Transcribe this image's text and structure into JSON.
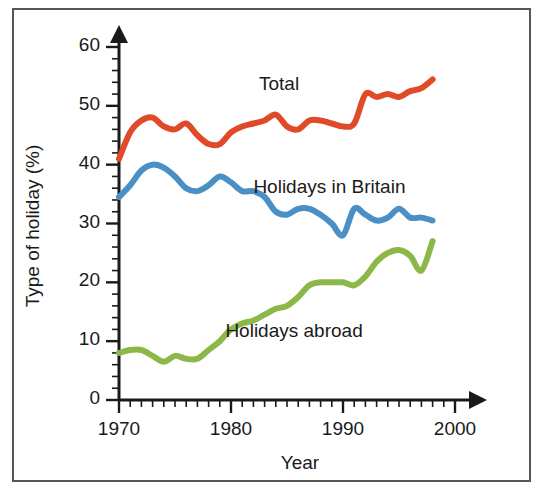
{
  "figure": {
    "border_color": "#55555c",
    "background": "#ffffff"
  },
  "chart_data": {
    "type": "line",
    "title": "",
    "xlabel": "Year",
    "ylabel": "Type of holiday (%)",
    "xlim": [
      1970,
      2000
    ],
    "ylim": [
      0,
      60
    ],
    "xticks": [
      1970,
      1980,
      1990,
      2000
    ],
    "xtick_labels": [
      "1970",
      "1980",
      "1990",
      "2000"
    ],
    "yticks": [
      0,
      10,
      20,
      30,
      40,
      50,
      60
    ],
    "ytick_labels": [
      "0",
      "10",
      "20",
      "30",
      "40",
      "50",
      "60"
    ],
    "x_minor_tick_step": 1,
    "y_minor_tick_step": 2,
    "grid": false,
    "legend_position": "inline-annotations",
    "x": [
      1970,
      1971,
      1972,
      1973,
      1974,
      1975,
      1976,
      1977,
      1978,
      1979,
      1980,
      1981,
      1982,
      1983,
      1984,
      1985,
      1986,
      1987,
      1988,
      1989,
      1990,
      1991,
      1992,
      1993,
      1994,
      1995,
      1996,
      1997,
      1998
    ],
    "series": [
      {
        "name": "Total",
        "color": "#e04a28",
        "values": [
          41.0,
          45.5,
          47.5,
          48.0,
          46.5,
          46.0,
          47.0,
          45.0,
          43.5,
          43.5,
          45.5,
          46.5,
          47.0,
          47.5,
          48.5,
          46.5,
          46.0,
          47.5,
          47.5,
          47.0,
          46.5,
          47.0,
          52.0,
          51.5,
          52.0,
          51.5,
          52.5,
          53.0,
          54.5
        ]
      },
      {
        "name": "Holidays in Britain",
        "color": "#4a90c4",
        "values": [
          34.5,
          36.5,
          39.0,
          40.0,
          39.5,
          38.0,
          36.0,
          35.5,
          36.5,
          38.0,
          37.0,
          35.5,
          35.5,
          34.5,
          32.0,
          31.5,
          32.5,
          32.5,
          31.5,
          30.0,
          28.0,
          32.5,
          31.5,
          30.5,
          31.0,
          32.5,
          31.0,
          31.0,
          30.5
        ]
      },
      {
        "name": "Holidays abroad",
        "color": "#8cb84a",
        "values": [
          8.0,
          8.5,
          8.5,
          7.5,
          6.5,
          7.5,
          7.0,
          7.0,
          8.5,
          10.0,
          12.0,
          13.0,
          13.5,
          14.5,
          15.5,
          16.0,
          17.5,
          19.5,
          20.0,
          20.0,
          20.0,
          19.5,
          21.0,
          23.5,
          25.0,
          25.5,
          24.5,
          22.0,
          27.0
        ]
      }
    ],
    "annotations": [
      {
        "text": "Total",
        "x": 1982.5,
        "y": 53.5
      },
      {
        "text": "Holidays in Britain",
        "x": 1982.0,
        "y": 36.0
      },
      {
        "text": "Holidays abroad",
        "x": 1979.5,
        "y": 11.5
      }
    ]
  }
}
